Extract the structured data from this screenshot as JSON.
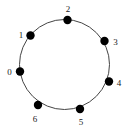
{
  "figure": {
    "type": "cycle-graph-diagram",
    "background_color": "#ffffff",
    "stroke_color": "#444444",
    "node_color": "#000000",
    "label_color": "#1a1a1a",
    "circle": {
      "center_x": 64.5,
      "center_y": 64.5,
      "radius": 45,
      "stroke_width": 1
    },
    "node_radius": 4.2,
    "nodes": [
      {
        "label": "0",
        "x": 20.0,
        "y": 71.5,
        "label_x": 9.5,
        "label_y": 71.5
      },
      {
        "label": "1",
        "x": 30.5,
        "y": 35.5,
        "label_x": 21.0,
        "label_y": 34.5
      },
      {
        "label": "2",
        "x": 67.5,
        "y": 20.0,
        "label_x": 68.0,
        "label_y": 9.0
      },
      {
        "label": "3",
        "x": 104.5,
        "y": 41.0,
        "label_x": 115.5,
        "label_y": 42.0
      },
      {
        "label": "4",
        "x": 109.0,
        "y": 81.5,
        "label_x": 119.0,
        "label_y": 83.0
      },
      {
        "label": "5",
        "x": 80.0,
        "y": 109.0,
        "label_x": 81.0,
        "label_y": 121.5
      },
      {
        "label": "6",
        "x": 38.0,
        "y": 105.0,
        "label_x": 35.0,
        "label_y": 119.0
      }
    ]
  }
}
